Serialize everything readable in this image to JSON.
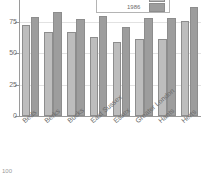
{
  "chart_data": {
    "type": "bar",
    "title": "Percentage",
    "xlabel": "",
    "ylabel": "",
    "categories": [
      "Beds",
      "Berks",
      "Bucks",
      "East Sussex",
      "Essex",
      "Greater London",
      "Hants",
      "Herts"
    ],
    "series": [
      {
        "name": "1981",
        "color": "#bdbdbd",
        "values": [
          73,
          68,
          68,
          64,
          60,
          62,
          62,
          77
        ]
      },
      {
        "name": "1986",
        "color": "#9d9d9d",
        "values": [
          80,
          84,
          78,
          81,
          72,
          79,
          79,
          88
        ]
      }
    ],
    "ylim": [
      0,
      88
    ],
    "yticks": [
      0,
      25,
      50,
      75
    ],
    "ytick_labels": [
      "0",
      "25",
      "50",
      "75"
    ],
    "grid": true,
    "legend_position": "top-right"
  },
  "axis": {
    "y_labels": [
      "75",
      "50",
      "25",
      "0"
    ]
  },
  "legend": {
    "title": "Percentage",
    "entries": [
      {
        "label": "1981",
        "color": "#bdbdbd"
      },
      {
        "label": "1986",
        "color": "#9d9d9d"
      }
    ]
  },
  "footer": {
    "fragment": "100"
  },
  "colors": {
    "series_1981": "#bdbdbd",
    "series_1986": "#9d9d9d",
    "axis": "#9a9a9a",
    "grid": "#e2e2e2",
    "text": "#6b6b6b"
  }
}
